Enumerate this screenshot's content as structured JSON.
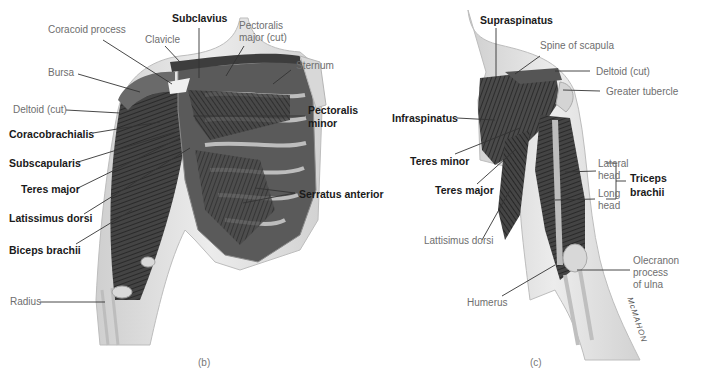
{
  "figure_b": {
    "panel_label": "(b)",
    "labels": {
      "coracoid_process": "Coracoid process",
      "clavicle": "Clavicle",
      "subclavius": "Subclavius",
      "pectoralis_major_cut_1": "Pectoralis",
      "pectoralis_major_cut_2": "major (cut)",
      "sternum": "Sternum",
      "bursa": "Bursa",
      "deltoid_cut": "Deltoid (cut)",
      "pectoralis_minor_1": "Pectoralis",
      "pectoralis_minor_2": "minor",
      "coracobrachialis": "Coracobrachialis",
      "subscapularis": "Subscapularis",
      "teres_major": "Teres major",
      "serratus_anterior": "Serratus anterior",
      "latissimus_dorsi": "Latissimus dorsi",
      "biceps_brachii": "Biceps brachii",
      "radius": "Radius"
    }
  },
  "figure_c": {
    "panel_label": "(c)",
    "signature": "McMAHON",
    "labels": {
      "supraspinatus": "Supraspinatus",
      "spine_of_scapula": "Spine of scapula",
      "deltoid_cut": "Deltoid (cut)",
      "greater_tubercle": "Greater tubercle",
      "infraspinatus": "Infraspinatus",
      "teres_minor": "Teres minor",
      "teres_major": "Teres major",
      "lateral_head_1": "Lateral",
      "lateral_head_2": "head",
      "long_head_1": "Long",
      "long_head_2": "head",
      "triceps_brachii_1": "Triceps",
      "triceps_brachii_2": "brachii",
      "lattisimus_dorsi": "Lattisimus dorsi",
      "olecranon_1": "Olecranon",
      "olecranon_2": "process",
      "olecranon_3": "of ulna",
      "humerus": "Humerus"
    }
  },
  "colors": {
    "muscle": "#3a3a3a",
    "skin": "#e4e4e4",
    "bone": "#d6d6d6",
    "bold_text": "#1a1a1a",
    "light_text": "#6e6e6e"
  }
}
